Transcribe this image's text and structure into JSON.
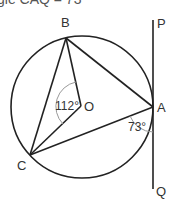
{
  "caption": "gle CAQ = 73",
  "diagram": {
    "points": {
      "B": "B",
      "O": "O",
      "A": "A",
      "C": "C",
      "P": "P",
      "Q": "Q"
    },
    "angles": {
      "BOC": "112°",
      "CAQ": "73°"
    },
    "colors": {
      "stroke": "#222222",
      "arc": "#999999",
      "text": "#333333"
    }
  }
}
